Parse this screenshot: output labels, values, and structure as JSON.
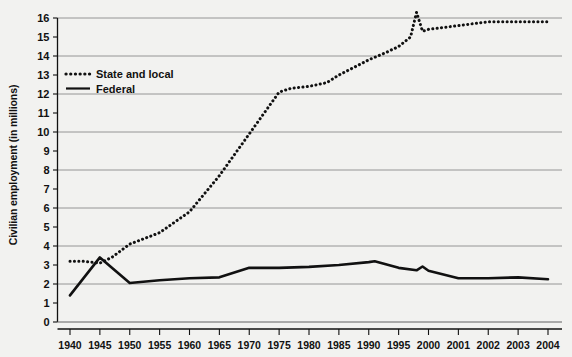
{
  "chart_data": {
    "type": "line",
    "title": "",
    "subtitle": "",
    "xlabel": "",
    "ylabel": "Civilian employment (in millions)",
    "ylim": [
      0,
      16
    ],
    "ytick_step": 1,
    "gridlines": "horizontal at even values (0, 2, 4, 6, 8, 10, 12, 14, 16)",
    "legend_position": "upper-left inside plot area",
    "categories": [
      "1940",
      "1945",
      "1950",
      "1955",
      "1960",
      "1965",
      "1970",
      "1975",
      "1980",
      "1985",
      "1990",
      "1995",
      "2000",
      "2001",
      "2002",
      "2003",
      "2004"
    ],
    "ytick_labels": [
      "0",
      "1",
      "2",
      "3",
      "4",
      "5",
      "6",
      "7",
      "8",
      "9",
      "10",
      "11",
      "12",
      "13",
      "14",
      "15",
      "16"
    ],
    "series": [
      {
        "name": "State and local",
        "style": "dotted",
        "color": "#111111",
        "x": [
          1940,
          1942,
          1945,
          1947,
          1950,
          1955,
          1960,
          1965,
          1970,
          1975,
          1977,
          1980,
          1983,
          1985,
          1990,
          1993,
          1995,
          1997,
          1998,
          1999,
          2000,
          2001,
          2002,
          2003,
          2004
        ],
        "values": [
          3.2,
          3.2,
          3.1,
          3.4,
          4.1,
          4.7,
          5.8,
          7.7,
          9.9,
          12.1,
          12.3,
          12.4,
          12.6,
          13.0,
          13.8,
          14.2,
          14.5,
          15.0,
          16.3,
          15.3,
          15.4,
          15.6,
          15.8,
          15.8,
          15.8
        ]
      },
      {
        "name": "Federal",
        "style": "solid",
        "color": "#111111",
        "x": [
          1940,
          1945,
          1950,
          1955,
          1960,
          1965,
          1970,
          1975,
          1980,
          1985,
          1990,
          1991,
          1995,
          1998,
          1999,
          2000,
          2001,
          2002,
          2003,
          2004
        ],
        "values": [
          1.4,
          3.4,
          2.05,
          2.2,
          2.3,
          2.35,
          2.85,
          2.85,
          2.9,
          3.0,
          3.15,
          3.2,
          2.85,
          2.72,
          2.92,
          2.7,
          2.3,
          2.3,
          2.35,
          2.25
        ]
      }
    ],
    "annotations": [
      "Dotted series spikes sharply just before 2000 (decennial census-related state/local peak) then drops and recovers.",
      "Solid Federal series shows a small temporary bump near 1999-2000."
    ]
  },
  "legend": {
    "items": [
      {
        "label": "State and local",
        "marker": "dotted-line"
      },
      {
        "label": "Federal",
        "marker": "solid-line"
      }
    ]
  },
  "axis": {
    "y_title": "Civilian employment (in millions)"
  }
}
